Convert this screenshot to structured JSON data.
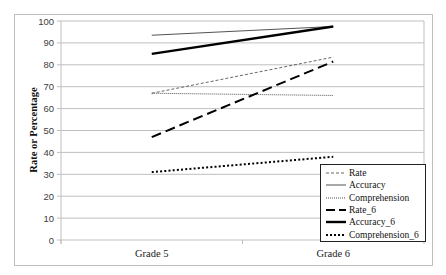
{
  "chart_data": {
    "type": "line",
    "title": "",
    "xlabel": "",
    "ylabel": "Rate or Percentage",
    "ylim": [
      0,
      100
    ],
    "yticks": [
      0,
      10,
      20,
      30,
      40,
      50,
      60,
      70,
      80,
      90,
      100
    ],
    "grid": true,
    "legend_position": "lower right (inside plot)",
    "categories": [
      "Grade 5",
      "Grade 6"
    ],
    "series": [
      {
        "name": "Rate",
        "values": [
          67,
          83.5
        ],
        "style": "thin dashed",
        "color": "#404040"
      },
      {
        "name": "Accuracy",
        "values": [
          93.5,
          97.5
        ],
        "style": "thin solid",
        "color": "#404040"
      },
      {
        "name": "Comprehension",
        "values": [
          67,
          66
        ],
        "style": "thin dotted",
        "color": "#404040"
      },
      {
        "name": "Rate_6",
        "values": [
          47,
          81.5
        ],
        "style": "thick long dash",
        "color": "#000000"
      },
      {
        "name": "Accuracy_6",
        "values": [
          85,
          97.5
        ],
        "style": "thick solid",
        "color": "#000000"
      },
      {
        "name": "Comprehension_6",
        "values": [
          31,
          38
        ],
        "style": "thick dotted",
        "color": "#000000"
      }
    ]
  },
  "legend": {
    "items": [
      "Rate",
      "Accuracy",
      "Comprehension",
      "Rate_6",
      "Accuracy_6",
      "Comprehension_6"
    ]
  },
  "axis": {
    "y_title": "Rate or Percentage",
    "y_ticks": [
      "0",
      "10",
      "20",
      "30",
      "40",
      "50",
      "60",
      "70",
      "80",
      "90",
      "100"
    ],
    "x_categories": [
      "Grade 5",
      "Grade 6"
    ]
  }
}
